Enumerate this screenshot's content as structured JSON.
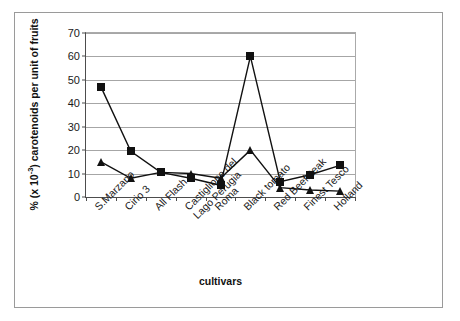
{
  "chart_data": {
    "type": "line",
    "title": "",
    "xlabel": "cultivars",
    "ylabel": "% (x 10-3) carotenoids per unit of fruits",
    "ylabel_prefix": "% (x 10",
    "ylabel_exponent": "-3",
    "ylabel_suffix": ") carotenoids per unit of fruits",
    "categories": [
      "S.Marzano",
      "Cirio 3",
      "All Flash",
      "Castiglione del\nLago Perugia",
      "Roma",
      "Black tomato",
      "Red Beefsteak",
      "Finest Tesco",
      "Holland"
    ],
    "series": [
      {
        "name": "series-squares",
        "marker": "square",
        "values": [
          47,
          19.5,
          10.5,
          8,
          5,
          60,
          6.5,
          9.5,
          13.5
        ]
      },
      {
        "name": "series-triangles",
        "marker": "triangle",
        "values": [
          15,
          8,
          10.5,
          10,
          8,
          20,
          4,
          3,
          2.5
        ]
      }
    ],
    "ylim": [
      0,
      70
    ],
    "ytick_values": [
      0,
      10,
      20,
      30,
      40,
      50,
      60,
      70
    ],
    "ytick_labels": [
      "0",
      "10",
      "20",
      "30",
      "40",
      "50",
      "60",
      "70"
    ],
    "grid": true,
    "legend": "none",
    "line_color": "#111111",
    "grid_color": "#a6a6a6",
    "axis_color": "#4d4d4d",
    "frame_color": "#9a9a9a"
  }
}
